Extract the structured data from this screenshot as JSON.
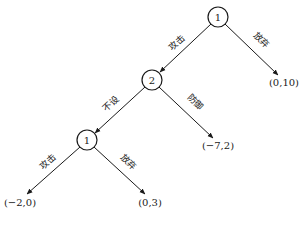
{
  "diagram": {
    "type": "game-tree",
    "colors": {
      "line": "#1a1a1a",
      "background": "#ffffff"
    },
    "nodes": [
      {
        "id": "n1",
        "label": "1",
        "player": "1",
        "cx": 218,
        "cy": 17
      },
      {
        "id": "n2",
        "label": "2",
        "player": "2",
        "cx": 152,
        "cy": 80
      },
      {
        "id": "n3",
        "label": "1",
        "player": "1",
        "cx": 87,
        "cy": 140
      }
    ],
    "edges": [
      {
        "from": "n1",
        "to": "n2",
        "label": "攻击"
      },
      {
        "from": "n1",
        "to": "leaf1",
        "label": "放弃"
      },
      {
        "from": "n2",
        "to": "n3",
        "label": "不设"
      },
      {
        "from": "n2",
        "to": "leaf2",
        "label": "防御"
      },
      {
        "from": "n3",
        "to": "leaf3",
        "label": "攻击"
      },
      {
        "from": "n3",
        "to": "leaf4",
        "label": "放弃"
      }
    ],
    "leaves": [
      {
        "id": "leaf1",
        "payoff": "(0,10)"
      },
      {
        "id": "leaf2",
        "payoff": "(−7,2)"
      },
      {
        "id": "leaf3",
        "payoff": "(−2,0)"
      },
      {
        "id": "leaf4",
        "payoff": "(0,3)"
      }
    ]
  }
}
